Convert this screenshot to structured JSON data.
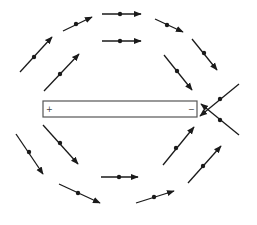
{
  "diagram": {
    "colors": {
      "line": "#1a1a1a",
      "bar_stroke": "#555555",
      "bar_fill": "#ffffff"
    },
    "bar": {
      "x": 43,
      "y": 101,
      "width": 154,
      "height": 16,
      "left_label": "+",
      "right_label": "−"
    },
    "needles": [
      {
        "id": "top-outer",
        "x1": 102,
        "y1": 14,
        "x2": 141,
        "y2": 14,
        "dx": 120,
        "dy": 14
      },
      {
        "id": "top-inner",
        "x1": 102,
        "y1": 41,
        "x2": 141,
        "y2": 41,
        "dx": 120,
        "dy": 41
      },
      {
        "id": "upper-left-outer",
        "x1": 63,
        "y1": 31,
        "x2": 92,
        "y2": 17,
        "dx": 76,
        "dy": 24
      },
      {
        "id": "upper-right-outer",
        "x1": 155,
        "y1": 19,
        "x2": 183,
        "y2": 32,
        "dx": 167,
        "dy": 25
      },
      {
        "id": "left-outer",
        "x1": 20,
        "y1": 72,
        "x2": 52,
        "y2": 37,
        "dx": 34,
        "dy": 57
      },
      {
        "id": "left-inner",
        "x1": 44,
        "y1": 91,
        "x2": 79,
        "y2": 54,
        "dx": 60,
        "dy": 74
      },
      {
        "id": "right-inner",
        "x1": 164,
        "y1": 55,
        "x2": 192,
        "y2": 90,
        "dx": 177,
        "dy": 71
      },
      {
        "id": "right-outer",
        "x1": 192,
        "y1": 39,
        "x2": 217,
        "y2": 70,
        "dx": 204,
        "dy": 53
      },
      {
        "id": "right-cross-upper",
        "x1": 239,
        "y1": 84,
        "x2": 200,
        "y2": 116,
        "dx": 220,
        "dy": 99
      },
      {
        "id": "right-cross-lower",
        "x1": 239,
        "y1": 135,
        "x2": 201,
        "y2": 104,
        "dx": 220,
        "dy": 120
      },
      {
        "id": "lower-left-outer",
        "x1": 16,
        "y1": 134,
        "x2": 43,
        "y2": 174,
        "dx": 29,
        "dy": 152
      },
      {
        "id": "lower-left-inner",
        "x1": 43,
        "y1": 125,
        "x2": 78,
        "y2": 164,
        "dx": 60,
        "dy": 143
      },
      {
        "id": "lower-right-inner",
        "x1": 163,
        "y1": 165,
        "x2": 194,
        "y2": 127,
        "dx": 176,
        "dy": 148
      },
      {
        "id": "lower-right-outer",
        "x1": 188,
        "y1": 183,
        "x2": 221,
        "y2": 146,
        "dx": 203,
        "dy": 166
      },
      {
        "id": "bottom-center",
        "x1": 101,
        "y1": 177,
        "x2": 138,
        "y2": 177,
        "dx": 119,
        "dy": 177
      },
      {
        "id": "bottom-left",
        "x1": 59,
        "y1": 184,
        "x2": 100,
        "y2": 203,
        "dx": 78,
        "dy": 193
      },
      {
        "id": "bottom-right",
        "x1": 136,
        "y1": 203,
        "x2": 174,
        "y2": 191,
        "dx": 154,
        "dy": 197
      }
    ]
  }
}
